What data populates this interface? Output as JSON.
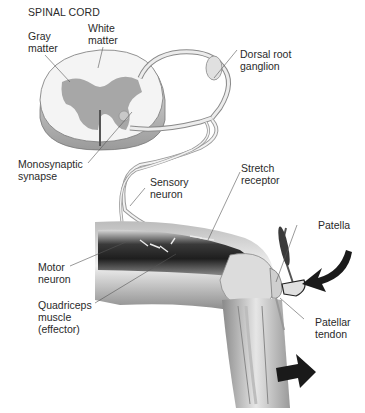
{
  "title": "SPINAL CORD",
  "labels": {
    "gray_matter": "Gray\nmatter",
    "white_matter": "White\nmatter",
    "dorsal_root_ganglion": "Dorsal root\nganglion",
    "monosynaptic_synapse": "Monosynaptic\nsynapse",
    "sensory_neuron": "Sensory\nneuron",
    "stretch_receptor": "Stretch\nreceptor",
    "patella": "Patella",
    "motor_neuron": "Motor\nneuron",
    "quadriceps": "Quadriceps\nmuscle\n(effector)",
    "patellar_tendon": "Patellar\ntendon"
  }
}
